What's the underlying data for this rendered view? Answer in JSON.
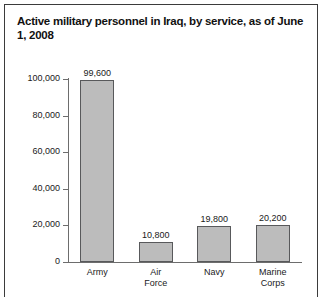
{
  "chart_data": {
    "type": "bar",
    "title": "Active military personnel in Iraq, by service, as of June 1, 2008",
    "categories": [
      "Army",
      "Air Force",
      "Navy",
      "Marine Corps"
    ],
    "values": [
      99600,
      10800,
      19800,
      20200
    ],
    "value_labels": [
      "99,600",
      "10,800",
      "19,800",
      "20,200"
    ],
    "xlabel": "",
    "ylabel": "",
    "ylim": [
      0,
      100000
    ],
    "yticks": [
      0,
      20000,
      40000,
      60000,
      80000,
      100000
    ],
    "ytick_labels": [
      "0",
      "20,000",
      "40,000",
      "60,000",
      "80,000",
      "100,000"
    ],
    "grid": false,
    "legend": null,
    "bar_color": "#bcbcbc",
    "bar_border_color": "#58595b",
    "axis_color": "#6d6d6d",
    "text_color": "#1a1a1a",
    "background": "#ffffff",
    "frame_color": "#3b3b3b"
  }
}
